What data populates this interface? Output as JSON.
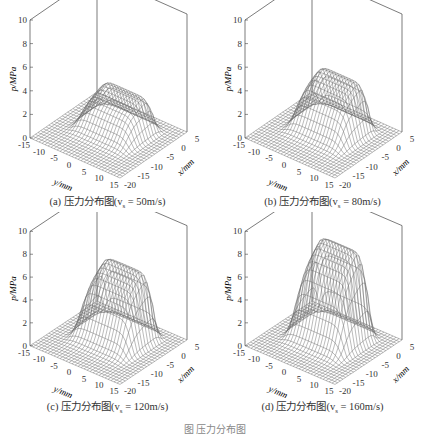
{
  "figure_caption": "图  压力分布图",
  "chart_data": [
    {
      "type": "surface",
      "title": "(a) 压力分布图(v_s = 50m/s)",
      "caption_prefix": "(a) 压力分布图(v",
      "caption_sub": "s",
      "caption_suffix": " = 50m/s)",
      "zlabel": "p/MPa",
      "xlabel": "x/mm",
      "ylabel": "y/mm",
      "zlim": [
        0,
        10
      ],
      "zticks": [
        0,
        2,
        4,
        6,
        8,
        10
      ],
      "xlim": [
        -20,
        5
      ],
      "xticks": [
        -20,
        -15,
        -10,
        -5,
        0,
        5
      ],
      "ylim": [
        -15,
        15
      ],
      "yticks": [
        -15,
        -10,
        -5,
        0,
        5,
        10,
        15
      ],
      "peak_pressure": 3.2
    },
    {
      "type": "surface",
      "title": "(b) 压力分布图(v_s = 80m/s)",
      "caption_prefix": "(b) 压力分布图(v",
      "caption_sub": "s",
      "caption_suffix": " = 80m/s)",
      "zlabel": "p/MPa",
      "xlabel": "x/mm",
      "ylabel": "y/mm",
      "zlim": [
        0,
        10
      ],
      "zticks": [
        0,
        2,
        4,
        6,
        8,
        10
      ],
      "xlim": [
        -20,
        5
      ],
      "xticks": [
        -20,
        -15,
        -10,
        -5,
        0,
        5
      ],
      "ylim": [
        -15,
        15
      ],
      "yticks": [
        -15,
        -10,
        -5,
        0,
        5,
        10,
        15
      ],
      "peak_pressure": 4.6
    },
    {
      "type": "surface",
      "title": "(c) 压力分布图(v_s = 120m/s)",
      "caption_prefix": "(c) 压力分布图(v",
      "caption_sub": "s",
      "caption_suffix": " = 120m/s)",
      "zlabel": "p/MPa",
      "xlabel": "x/mm",
      "ylabel": "y/mm",
      "zlim": [
        0,
        10
      ],
      "zticks": [
        0,
        2,
        4,
        6,
        8,
        10
      ],
      "xlim": [
        -20,
        5
      ],
      "xticks": [
        -20,
        -15,
        -10,
        -5,
        0,
        5
      ],
      "ylim": [
        -15,
        15
      ],
      "yticks": [
        -15,
        -10,
        -5,
        0,
        5,
        10,
        15
      ],
      "peak_pressure": 6.5
    },
    {
      "type": "surface",
      "title": "(d) 压力分布图(v_s = 160m/s)",
      "caption_prefix": "(d) 压力分布图(v",
      "caption_sub": "s",
      "caption_suffix": " = 160m/s)",
      "zlabel": "p/MPa",
      "xlabel": "x/mm",
      "ylabel": "y/mm",
      "zlim": [
        0,
        10
      ],
      "zticks": [
        0,
        2,
        4,
        6,
        8,
        10
      ],
      "xlim": [
        -20,
        5
      ],
      "xticks": [
        -20,
        -15,
        -10,
        -5,
        0,
        5
      ],
      "ylim": [
        -15,
        15
      ],
      "yticks": [
        -15,
        -10,
        -5,
        0,
        5,
        10,
        15
      ],
      "peak_pressure": 8.5
    }
  ]
}
